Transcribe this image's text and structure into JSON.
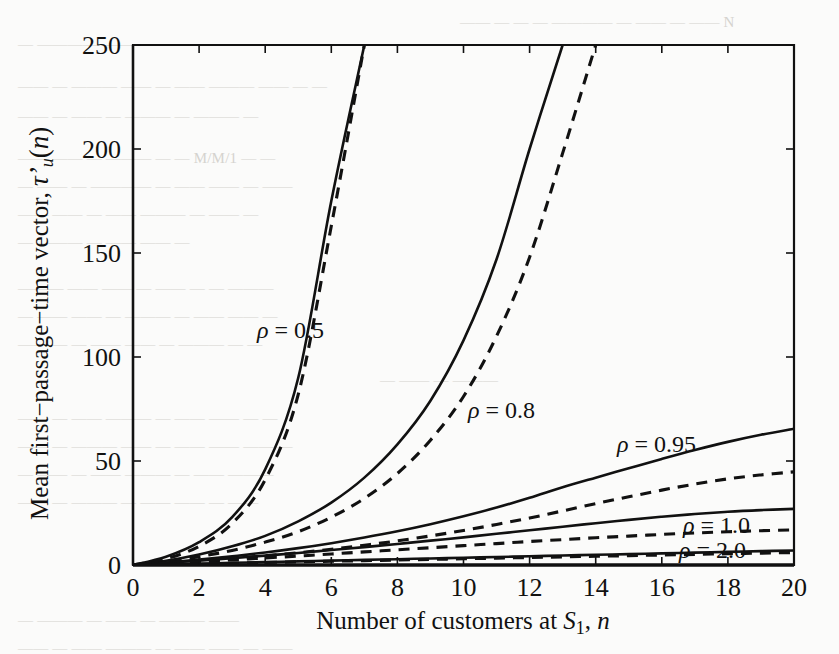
{
  "figure": {
    "background_color": "#fbfbfa",
    "ink_color": "#111111",
    "plot_box": {
      "left": 133,
      "top": 45,
      "right": 794,
      "bottom": 565
    }
  },
  "chart_data": {
    "type": "line",
    "title": "",
    "xlabel": "Number of customers at S₁, n",
    "ylabel": "Mean first−passage−time vector, τ'ᵤ(n)",
    "xlim": [
      0,
      20
    ],
    "ylim": [
      0,
      250
    ],
    "xticks": [
      0,
      2,
      4,
      6,
      8,
      10,
      12,
      14,
      16,
      18,
      20
    ],
    "yticks": [
      0,
      50,
      100,
      150,
      200,
      250
    ],
    "xticklabels": [
      "0",
      "2",
      "4",
      "6",
      "8",
      "10",
      "12",
      "14",
      "16",
      "18",
      "20"
    ],
    "yticklabels": [
      "0",
      "50",
      "100",
      "150",
      "200",
      "250"
    ],
    "grid": false,
    "legend": "inline-annotations",
    "x": [
      0,
      1,
      2,
      3,
      4,
      5,
      6,
      7,
      8,
      9,
      10,
      11,
      12,
      13,
      14,
      15,
      16,
      17,
      18,
      19,
      20
    ],
    "series": [
      {
        "name": "rho=0.5 exact",
        "rho": 0.5,
        "style": "solid",
        "values": [
          0,
          4,
          11,
          23,
          46,
          90,
          175,
          250,
          null,
          null,
          null,
          null,
          null,
          null,
          null,
          null,
          null,
          null,
          null,
          null,
          null
        ]
      },
      {
        "name": "rho=0.5 approx",
        "rho": 0.5,
        "style": "dashed",
        "values": [
          0,
          3,
          9,
          20,
          41,
          82,
          163,
          250,
          null,
          null,
          null,
          null,
          null,
          null,
          null,
          null,
          null,
          null,
          null,
          null,
          null
        ]
      },
      {
        "name": "rho=0.8 exact",
        "rho": 0.8,
        "style": "solid",
        "values": [
          0,
          2,
          5,
          9,
          14,
          21,
          30,
          42,
          58,
          79,
          108,
          147,
          200,
          250,
          null,
          null,
          null,
          null,
          null,
          null,
          null
        ]
      },
      {
        "name": "rho=0.8 approx",
        "rho": 0.8,
        "style": "dashed",
        "values": [
          0,
          1.5,
          4,
          7,
          11,
          16,
          23,
          32,
          44,
          60,
          81,
          110,
          148,
          198,
          250,
          null,
          null,
          null,
          null,
          null,
          null
        ]
      },
      {
        "name": "rho=0.95 exact",
        "rho": 0.95,
        "style": "solid",
        "values": [
          0,
          1.2,
          2.6,
          4.2,
          6.0,
          8.1,
          10.5,
          13.2,
          16.2,
          19.6,
          23.4,
          27.6,
          32.3,
          37.4,
          42.0,
          46.5,
          51.0,
          55.3,
          59.2,
          62.6,
          65.5
        ]
      },
      {
        "name": "rho=0.95 approx",
        "rho": 0.95,
        "style": "dashed",
        "values": [
          0,
          0.9,
          1.9,
          3.1,
          4.4,
          5.9,
          7.6,
          9.5,
          11.6,
          14.0,
          16.6,
          19.5,
          22.6,
          26.0,
          29.5,
          32.8,
          36.0,
          38.9,
          41.4,
          43.3,
          44.8
        ]
      },
      {
        "name": "rho=1.0 exact",
        "rho": 1.0,
        "style": "solid",
        "values": [
          0,
          1.0,
          2.1,
          3.3,
          4.5,
          5.8,
          7.2,
          8.6,
          10.1,
          11.7,
          13.3,
          15.0,
          16.7,
          18.4,
          20.1,
          21.7,
          23.2,
          24.5,
          25.6,
          26.4,
          27.0
        ]
      },
      {
        "name": "rho=1.0 approx",
        "rho": 1.0,
        "style": "dashed",
        "values": [
          0,
          0.8,
          1.6,
          2.5,
          3.4,
          4.3,
          5.3,
          6.3,
          7.3,
          8.3,
          9.3,
          10.3,
          11.3,
          12.2,
          13.1,
          13.9,
          14.7,
          15.4,
          16.0,
          16.5,
          16.9
        ]
      },
      {
        "name": "rho=2.0 exact",
        "rho": 2.0,
        "style": "solid",
        "values": [
          0,
          0.35,
          0.7,
          1.05,
          1.4,
          1.75,
          2.1,
          2.45,
          2.8,
          3.15,
          3.5,
          3.85,
          4.2,
          4.55,
          4.9,
          5.25,
          5.6,
          5.95,
          6.3,
          6.65,
          7.0
        ]
      },
      {
        "name": "rho=2.0 approx",
        "rho": 2.0,
        "style": "dashed",
        "values": [
          0,
          0.3,
          0.6,
          0.9,
          1.2,
          1.5,
          1.8,
          2.1,
          2.4,
          2.7,
          3.0,
          3.3,
          3.6,
          3.9,
          4.2,
          4.5,
          4.8,
          5.1,
          5.4,
          5.7,
          6.0
        ]
      }
    ],
    "annotations": [
      {
        "text": "ρ = 0.5",
        "x_px": 257,
        "y_px": 338
      },
      {
        "text": "ρ = 0.8",
        "x_px": 468,
        "y_px": 418
      },
      {
        "text": "ρ = 0.95",
        "x_px": 617,
        "y_px": 452
      },
      {
        "text": "ρ = 1.0",
        "x_px": 683,
        "y_px": 533
      },
      {
        "text": "ρ = 2.0",
        "x_px": 679,
        "y_px": 558
      }
    ]
  },
  "background_text": {
    "note": "faint show-through text from the reverse of the scanned page",
    "lines": [
      {
        "text": "—— — — — ———— — —— — —— N",
        "x": 460,
        "y": 14
      },
      {
        "text": "— ———— ——— — —— — ——— — ——",
        "x": 18,
        "y": 36
      },
      {
        "text": "—— — ——— —— — —— ——— —— — —",
        "x": 18,
        "y": 78
      },
      {
        "text": "—— — —— — ——— — ——— —",
        "x": 18,
        "y": 108
      },
      {
        "text": "—— —— — ——— — — M/M/1 — —",
        "x": 18,
        "y": 150
      },
      {
        "text": "— —— — ———— — —— —— — ——",
        "x": 18,
        "y": 178
      },
      {
        "text": "—— —— — —— ——— — —— —",
        "x": 18,
        "y": 206
      },
      {
        "text": "— ——— — —— —— —",
        "x": 18,
        "y": 234
      },
      {
        "text": "——— —— —— — —— — — ———",
        "x": 18,
        "y": 280
      },
      {
        "text": "— —— —— — ——— — —— —— —",
        "x": 18,
        "y": 308
      },
      {
        "text": "—— — — —— —— — ——— — —",
        "x": 18,
        "y": 336
      },
      {
        "text": "— —— — ———",
        "x": 380,
        "y": 372
      },
      {
        "text": "—— — —— ——— — —— —— — —",
        "x": 18,
        "y": 410
      },
      {
        "text": "—— — ——— —— — —— —— —— —",
        "x": 18,
        "y": 438
      },
      {
        "text": "— —— — —— ——— — —— ———",
        "x": 18,
        "y": 466
      },
      {
        "text": "—— — ——— — —— —— — ——",
        "x": 18,
        "y": 494
      },
      {
        "text": "— ——— — —— — ——— ——",
        "x": 18,
        "y": 612
      },
      {
        "text": "—— — —— ——— — —— —— — ——",
        "x": 18,
        "y": 640
      }
    ]
  }
}
